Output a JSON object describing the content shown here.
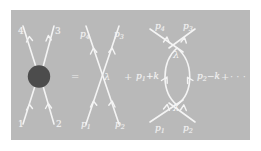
{
  "figure": {
    "caption_present": false,
    "panel_background": "#b9b9b9",
    "page_background": "#ffffff",
    "line_color": "#f4f4f4",
    "blob_color": "#4c4c4c",
    "text_color": "#f2f2f2"
  },
  "terms": {
    "equals": "=",
    "plus_first": "+",
    "plus_second": "+",
    "ellipsis": "· · ·"
  },
  "blob_diagram": {
    "name": "four-point-blob",
    "legs": {
      "upper_left": "4",
      "upper_right": "3",
      "lower_left": "1",
      "lower_right": "2"
    }
  },
  "tree_diagram": {
    "name": "tree-level-contact-vertex",
    "vertex": "λ",
    "legs": {
      "upper_left": "p",
      "upper_left_sub": "4",
      "upper_right": "p",
      "upper_right_sub": "3",
      "lower_left": "p",
      "lower_left_sub": "1",
      "lower_right": "p",
      "lower_right_sub": "2"
    }
  },
  "loop_diagram": {
    "name": "one-loop-bubble",
    "vertex_top": "λ",
    "vertex_bottom": "λ",
    "legs": {
      "upper_left": "p",
      "upper_left_sub": "4",
      "upper_right": "p",
      "upper_right_sub": "3",
      "lower_left": "p",
      "lower_left_sub": "1",
      "lower_right": "p",
      "lower_right_sub": "2"
    },
    "internal": {
      "left": "p",
      "left_sub": "1",
      "left_suffix": "+k",
      "right": "p",
      "right_sub": "2",
      "right_suffix": "−k"
    }
  }
}
